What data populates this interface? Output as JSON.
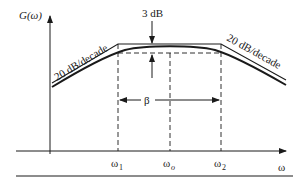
{
  "figure": {
    "y_axis_label": "G(ω)",
    "x_axis_label": "ω",
    "gap_label": "3 dB",
    "left_slope_label": "20 dB/decade",
    "right_slope_label": "20 dB/decade",
    "bandwidth_label": "β",
    "ticks": {
      "w1": {
        "base": "ω",
        "sub": "1"
      },
      "wo": {
        "base": "ω",
        "sub": "o"
      },
      "w2": {
        "base": "ω",
        "sub": "2"
      }
    },
    "colors": {
      "ink": "#1a1a1a",
      "background": "#ffffff"
    }
  }
}
